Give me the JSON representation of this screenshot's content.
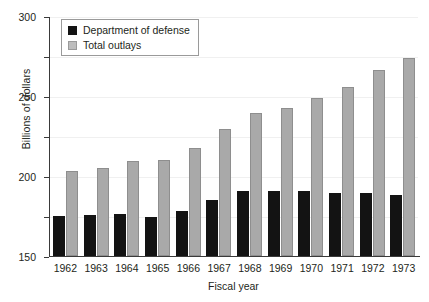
{
  "chart_data": {
    "type": "bar",
    "title": "",
    "xlabel": "Fiscal year",
    "ylabel": "Billions of dollars",
    "ylim": [
      0,
      300
    ],
    "yticks": [
      0,
      50,
      100,
      150,
      200,
      250,
      300
    ],
    "grid": true,
    "legend_position": "top-left",
    "categories": [
      "1962",
      "1963",
      "1964",
      "1965",
      "1966",
      "1967",
      "1968",
      "1969",
      "1970",
      "1971",
      "1972",
      "1973"
    ],
    "series": [
      {
        "name": "Department of defense",
        "color": "#131313",
        "values": [
          50,
          51,
          53,
          49,
          57,
          70,
          81,
          82,
          81,
          79,
          79,
          77
        ]
      },
      {
        "name": "Total outlays",
        "color": "#a9a9a9",
        "values": [
          107,
          111,
          119,
          120,
          136,
          159,
          180,
          186,
          198,
          212,
          233,
          248
        ]
      }
    ]
  }
}
